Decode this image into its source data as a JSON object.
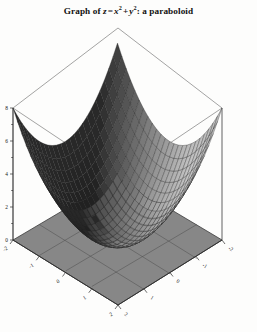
{
  "figure": {
    "title_prefix": "Graph of ",
    "title_var_z": "z",
    "title_eq": "=",
    "title_x": "x",
    "title_x_exp": "2",
    "title_plus": "+",
    "title_y": "y",
    "title_y_exp": "2",
    "title_suffix": ": a paraboloid",
    "title_plain": "Graph of z = x^2 + y^2: a paraboloid"
  },
  "colors": {
    "background": "#fdfdfc",
    "surface_dark": "#4a4a4a",
    "surface_mid": "#6d6d6d",
    "surface_light": "#9a9a9a",
    "surface_highlight": "#c9c9c9",
    "base_plane": "#878787",
    "mesh_line": "#2b2b2b",
    "axis_line": "#3a3a3a",
    "box_line": "#555555",
    "tick_text": "#1a1a1a"
  },
  "axes": {
    "z": {
      "label": "z",
      "ticks": [
        "8",
        "6",
        "4",
        "2",
        "0"
      ],
      "values": [
        8,
        6,
        4,
        2,
        0
      ],
      "min": 0,
      "max": 8
    },
    "x": {
      "label": "x",
      "ticks": [
        "-2",
        "-1",
        "0",
        "1",
        "2"
      ],
      "values": [
        -2,
        -1,
        0,
        1,
        2
      ],
      "min": -2,
      "max": 2
    },
    "y": {
      "label": "y",
      "ticks": [
        "2",
        "1",
        "0",
        "-1",
        "-2"
      ],
      "values": [
        2,
        1,
        0,
        -1,
        -2
      ],
      "min": -2,
      "max": 2
    }
  },
  "chart_data": {
    "type": "surface",
    "function": "z = x^2 + y^2",
    "xlabel": "x",
    "ylabel": "y",
    "zlabel": "z",
    "xlim": [
      -2,
      2
    ],
    "ylim": [
      -2,
      2
    ],
    "zlim": [
      0,
      8
    ],
    "x_ticks": [
      -2,
      -1,
      0,
      1,
      2
    ],
    "y_ticks": [
      -2,
      -1,
      0,
      1,
      2
    ],
    "z_ticks": [
      0,
      2,
      4,
      6,
      8
    ],
    "grid": true,
    "legend": "none",
    "mesh_divisions": 24,
    "projection": "orthographic-3d",
    "shading": "grayscale",
    "base_plane_z": 0,
    "base_plane_grid_divisions": 4,
    "surface_corner_values": [
      {
        "x": -2,
        "y": -2,
        "z": 8
      },
      {
        "x": 2,
        "y": -2,
        "z": 8
      },
      {
        "x": 2,
        "y": 2,
        "z": 8
      },
      {
        "x": -2,
        "y": 2,
        "z": 8
      },
      {
        "x": 0,
        "y": 0,
        "z": 0
      }
    ],
    "sample_points": [
      {
        "x": -2,
        "y": 0,
        "z": 4
      },
      {
        "x": -1,
        "y": 0,
        "z": 1
      },
      {
        "x": 0,
        "y": 0,
        "z": 0
      },
      {
        "x": 1,
        "y": 0,
        "z": 1
      },
      {
        "x": 2,
        "y": 0,
        "z": 4
      },
      {
        "x": 0,
        "y": -2,
        "z": 4
      },
      {
        "x": 0,
        "y": -1,
        "z": 1
      },
      {
        "x": 0,
        "y": 1,
        "z": 1
      },
      {
        "x": 0,
        "y": 2,
        "z": 4
      },
      {
        "x": -2,
        "y": -2,
        "z": 8
      },
      {
        "x": -2,
        "y": 2,
        "z": 8
      },
      {
        "x": 2,
        "y": -2,
        "z": 8
      },
      {
        "x": 2,
        "y": 2,
        "z": 8
      }
    ]
  }
}
